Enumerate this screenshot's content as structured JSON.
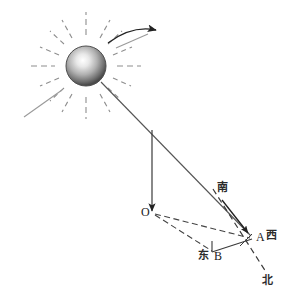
{
  "diagram": {
    "type": "physics-geometry-illustration",
    "background_color": "#ffffff",
    "line_color": "#333333",
    "labels": {
      "origin_point": "O",
      "point_a": "A",
      "point_b": "B",
      "west": "西",
      "east": "东",
      "south": "南",
      "north": "北"
    },
    "icons": {
      "sun": "sun-sphere-icon",
      "motion_arrow": "curved-motion-arrow-icon",
      "shadow_arrow": "shadow-direction-arrow-icon",
      "pole_arrow": "downward-pole-arrow-icon"
    },
    "colors": {
      "sun_core": "#ffffff",
      "sun_mid": "#b9b9b9",
      "sun_edge": "#555555",
      "ray": "#8a8a8a",
      "stroke": "#333333",
      "dashed": "#4a4a4a"
    },
    "geometry": {
      "sun_center": [
        86,
        66
      ],
      "sun_radius": 20,
      "pole_top": [
        152,
        132
      ],
      "pole_base": [
        152,
        212
      ],
      "point_o": [
        152,
        212
      ],
      "point_a": [
        252,
        239
      ],
      "point_b": [
        213,
        253
      ],
      "ray_start": [
        101,
        82
      ],
      "ray_end": [
        250,
        234
      ]
    },
    "ray_angles_deg": [
      0,
      22,
      45,
      68,
      90,
      112,
      135,
      158,
      180,
      202,
      225,
      248,
      270,
      292,
      315,
      338
    ]
  }
}
